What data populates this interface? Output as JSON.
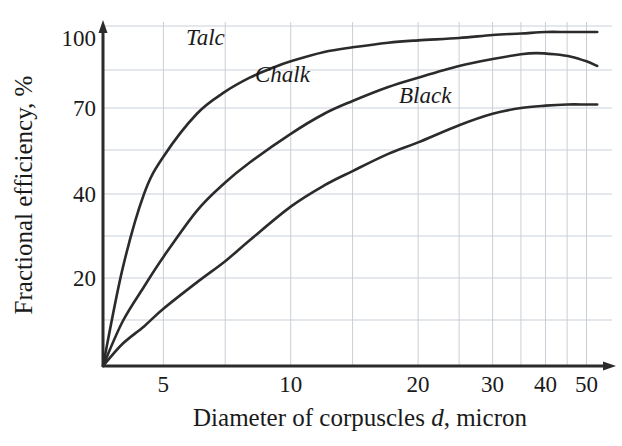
{
  "chart_data": {
    "type": "line",
    "title": "",
    "xlabel": "Diameter of corpuscles d, micron",
    "ylabel": "Fractional efficiency, %",
    "xlabel_parts": {
      "pre": "Diameter of corpuscles ",
      "variable": "d",
      "post": ", micron"
    },
    "x_scale": "log",
    "y_scale": "probability",
    "xticks": [
      5,
      10,
      20,
      30,
      40,
      50
    ],
    "xtick_labels": [
      "5",
      "10",
      "20",
      "30",
      "40",
      "50"
    ],
    "yticks": [
      20,
      40,
      70,
      100
    ],
    "ytick_labels": [
      "20",
      "40",
      "70",
      "100"
    ],
    "xlim": [
      3.6,
      55
    ],
    "ylim": [
      0,
      104
    ],
    "grid": true,
    "legend": "inline-labels",
    "series": [
      {
        "name": "Talc",
        "label": "Talc",
        "color": "#2b2b2b",
        "x": [
          3.6,
          4,
          4.5,
          5,
          6,
          7,
          8,
          9,
          10,
          12,
          14,
          17,
          20,
          25,
          30,
          35,
          40,
          45,
          50,
          53
        ],
        "y": [
          0,
          22,
          40,
          53,
          68,
          77,
          83,
          87,
          90,
          94,
          96,
          98,
          99,
          100,
          101,
          101.5,
          102,
          102,
          102,
          102
        ]
      },
      {
        "name": "Chalk",
        "label": "Chalk",
        "color": "#2b2b2b",
        "x": [
          3.6,
          4,
          4.5,
          5,
          6,
          7,
          8,
          10,
          12,
          14,
          17,
          20,
          25,
          30,
          35,
          38,
          42,
          46,
          50,
          53
        ],
        "y": [
          0,
          10,
          18,
          25,
          36,
          44,
          51,
          61,
          68,
          73,
          79,
          83,
          88,
          91,
          93,
          93.5,
          93,
          92,
          90,
          88
        ]
      },
      {
        "name": "Black",
        "label": "Black",
        "color": "#2b2b2b",
        "x": [
          3.6,
          4,
          4.5,
          5,
          6,
          7,
          8,
          10,
          12,
          14,
          17,
          20,
          25,
          30,
          35,
          40,
          45,
          50,
          53
        ],
        "y": [
          0,
          5,
          9,
          13,
          19,
          24,
          29,
          37,
          43,
          48,
          54,
          58,
          64,
          68,
          70,
          71,
          71.5,
          71.5,
          71.5
        ]
      }
    ],
    "annotations": [
      {
        "text": "Talc",
        "x_px": 186,
        "y_px": 45
      },
      {
        "text": "Chalk",
        "x_px": 255,
        "y_px": 82
      },
      {
        "text": "Black",
        "x_px": 399,
        "y_px": 103
      }
    ]
  },
  "axes": {
    "x_axis_name": "x-axis",
    "y_axis_name": "y-axis",
    "origin_px": {
      "x": 103,
      "y": 366
    },
    "right_px": 616,
    "top_px": 22
  },
  "colors": {
    "ink": "#2b2b2b",
    "grid": "#c9cfd8",
    "background": "#ffffff"
  }
}
